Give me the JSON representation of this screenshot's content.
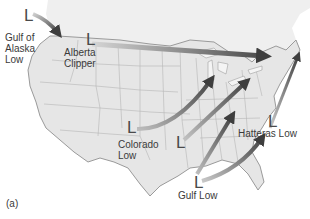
{
  "figure": {
    "panel_label": "(a)",
    "marker_symbol": "L"
  },
  "storm_tracks": [
    {
      "name_line1": "Gulf of",
      "name_line2": "Alaska",
      "name_line3": "Low"
    },
    {
      "name_line1": "Alberta",
      "name_line2": "Clipper"
    },
    {
      "name_line1": "Colorado",
      "name_line2": "Low"
    },
    {
      "name_line1": "Hatteras Low"
    },
    {
      "name_line1": "Gulf Low"
    }
  ],
  "colors": {
    "land": "#e8e8e8",
    "ocean": "#ffffff",
    "canada": "#efefef",
    "state_border": "#b5b5b5",
    "coast": "#9a9a9a",
    "arrow_dark": "#4a4a4a",
    "arrow_light": "#bdbdbd"
  }
}
